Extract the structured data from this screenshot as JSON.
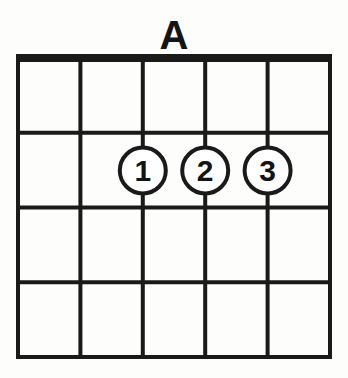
{
  "diagram": {
    "title": "A",
    "instrument_label": "guitar-chord-diagram",
    "colors": {
      "ink": "#1a1a1a",
      "background": "#fdfdfc",
      "dot_fill": "#ffffff"
    },
    "geometry": {
      "left": 18,
      "right": 330,
      "nut_y": 58,
      "bottom_y": 357,
      "nut_thickness": 8,
      "line_thickness": 4,
      "string_count": 6,
      "fret_count": 4,
      "string_x": [
        18,
        80.4,
        142.8,
        205.2,
        267.6,
        330
      ],
      "fret_y": [
        58,
        132.75,
        207.5,
        282.25,
        357
      ],
      "dot_radius": 23,
      "dot_stroke": 4
    },
    "strings": [
      {
        "index": 1,
        "name": "string-6-low-e",
        "x": 18
      },
      {
        "index": 2,
        "name": "string-5-a",
        "x": 80.4
      },
      {
        "index": 3,
        "name": "string-4-d",
        "x": 142.8
      },
      {
        "index": 4,
        "name": "string-3-g",
        "x": 205.2
      },
      {
        "index": 5,
        "name": "string-2-b",
        "x": 267.6
      },
      {
        "index": 6,
        "name": "string-1-high-e",
        "x": 330
      }
    ],
    "frets": [
      {
        "index": 0,
        "name": "nut",
        "y": 58,
        "thick": true
      },
      {
        "index": 1,
        "name": "fret-line-1",
        "y": 132.75,
        "thick": false
      },
      {
        "index": 2,
        "name": "fret-line-2",
        "y": 207.5,
        "thick": false
      },
      {
        "index": 3,
        "name": "fret-line-3",
        "y": 282.25,
        "thick": false
      },
      {
        "index": 4,
        "name": "fret-line-4-bottom",
        "y": 357,
        "thick": false
      }
    ],
    "fingerings": [
      {
        "label": "1",
        "string_index": 3,
        "fret": 2,
        "cx": 142.8,
        "cy": 170.5
      },
      {
        "label": "2",
        "string_index": 4,
        "fret": 2,
        "cx": 205.2,
        "cy": 170.5
      },
      {
        "label": "3",
        "string_index": 5,
        "fret": 2,
        "cx": 267.6,
        "cy": 170.5
      }
    ]
  }
}
